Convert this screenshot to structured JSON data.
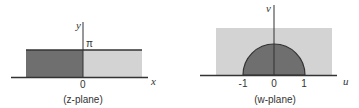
{
  "colors": {
    "dark_fill": "#6f6f6f",
    "light_fill": "#d3d3d3",
    "axis": "#333333",
    "text": "#333333"
  },
  "z_plane": {
    "caption": "(z-plane)",
    "x_axis_label": "x",
    "y_axis_label": "y",
    "origin_label": "0",
    "top_label": "π",
    "regions": [
      {
        "name": "left-half-strip",
        "shade": "dark"
      },
      {
        "name": "right-half-strip",
        "shade": "light"
      }
    ]
  },
  "w_plane": {
    "caption": "(w-plane)",
    "u_axis_label": "u",
    "v_axis_label": "v",
    "tick_labels": [
      "-1",
      "0",
      "1"
    ],
    "regions": [
      {
        "name": "upper-half-plane",
        "shade": "light"
      },
      {
        "name": "upper-half-unit-disk",
        "shade": "dark"
      }
    ]
  }
}
